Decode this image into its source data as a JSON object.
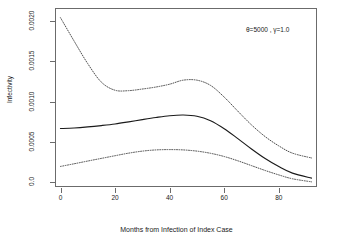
{
  "chart_data": {
    "type": "line",
    "title": "",
    "subtitle": "",
    "xlabel": "Months from Infection of Index Case",
    "ylabel": "Infectivity",
    "xlim": [
      -2,
      94
    ],
    "ylim": [
      -6e-05,
      0.00216
    ],
    "xticks": [
      0,
      20,
      40,
      60,
      80
    ],
    "xticklabels": [
      "0",
      "20",
      "40",
      "60",
      "80"
    ],
    "yticks": [
      0.0,
      0.0005,
      0.001,
      0.0015,
      0.002
    ],
    "yticklabels": [
      "0.0",
      "0.0005",
      "0.0010",
      "0.0015",
      "0.0020"
    ],
    "grid": false,
    "legend": null,
    "annotations": [
      {
        "text": "θ=5000 , γ=1.0",
        "x": 72,
        "y": 0.00202
      }
    ],
    "x": [
      0,
      5,
      10,
      15,
      20,
      25,
      30,
      35,
      40,
      45,
      50,
      55,
      60,
      65,
      70,
      75,
      80,
      85,
      92
    ],
    "series": [
      {
        "name": "upper confidence band",
        "style": "dotted",
        "color": "#3a3a3a",
        "values": [
          0.00204,
          0.00175,
          0.00147,
          0.00124,
          0.00114,
          0.001135,
          0.001155,
          0.00118,
          0.001215,
          0.001265,
          0.001265,
          0.0012,
          0.001055,
          0.00088,
          0.00071,
          0.000565,
          0.00045,
          0.00036,
          0.0003
        ]
      },
      {
        "name": "estimated infectivity",
        "style": "solid",
        "color": "#1a1a1a",
        "values": [
          0.000665,
          0.000672,
          0.000685,
          0.000702,
          0.000722,
          0.000748,
          0.000776,
          0.000802,
          0.000824,
          0.000833,
          0.000818,
          0.000762,
          0.000663,
          0.00054,
          0.000412,
          0.000293,
          0.000193,
          0.000112,
          5e-05
        ]
      },
      {
        "name": "lower confidence band",
        "style": "dotted",
        "color": "#3a3a3a",
        "values": [
          0.000195,
          0.000228,
          0.000262,
          0.000295,
          0.000328,
          0.00036,
          0.000385,
          0.0004,
          0.000404,
          0.0004,
          0.000385,
          0.000358,
          0.000318,
          0.000265,
          0.000205,
          0.000145,
          9e-05,
          4.2e-05,
          4e-06
        ]
      }
    ]
  },
  "figure": {
    "background_color": "#ffffff",
    "axis_color": "#6b6b6b",
    "text_color": "#1a1a1a"
  }
}
